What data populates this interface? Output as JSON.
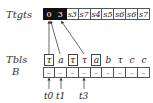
{
  "labels": {
    "top": "Ttgts",
    "middle": "Tbls",
    "bottom": "B"
  },
  "top_row": [
    {
      "text": "0",
      "dark": true
    },
    {
      "text": "3",
      "dark": true
    },
    {
      "text": "s3",
      "dark": false
    },
    {
      "text": "s7",
      "dark": false
    },
    {
      "text": "s4",
      "dark": false
    },
    {
      "text": "s5",
      "dark": false
    },
    {
      "text": "s6",
      "dark": false
    },
    {
      "text": "s6",
      "dark": false
    },
    {
      "text": "s7",
      "dark": false
    }
  ],
  "tbls_row": [
    {
      "text": "τ",
      "boxed": true
    },
    {
      "text": "a",
      "boxed": false
    },
    {
      "text": "τ",
      "boxed": true
    },
    {
      "text": "τ",
      "boxed": false
    },
    {
      "text": "a",
      "boxed": true
    },
    {
      "text": "b",
      "boxed": false
    },
    {
      "text": "τ",
      "boxed": false
    },
    {
      "text": "c",
      "boxed": false
    },
    {
      "text": "c",
      "boxed": false
    }
  ],
  "b_row": [
    "–",
    "–",
    "–",
    "–",
    "–",
    "–",
    "–",
    "–",
    "–"
  ],
  "pointers": [
    {
      "label": "t0",
      "column": 0
    },
    {
      "label": "t1",
      "column": 1
    },
    {
      "label": "t3",
      "column": 3
    }
  ],
  "colors": {
    "highlight": "#111111",
    "line": "#555555"
  }
}
